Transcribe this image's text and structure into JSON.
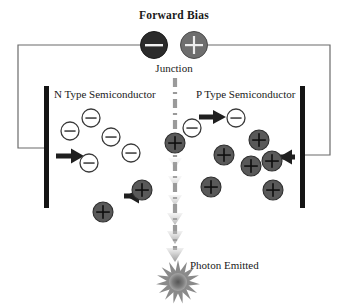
{
  "diagram": {
    "title": "Forward Bias",
    "junction_label": "Junction",
    "n_region_label": "N Type Semiconductor",
    "p_region_label": "P Type Semiconductor",
    "photon_label": "Photon Emitted",
    "battery": {
      "negative_terminal_symbol": "−",
      "positive_terminal_symbol": "+",
      "negative_terminal_color": "#2b2b2b",
      "positive_terminal_color": "#6e6e6e"
    },
    "colors": {
      "wire": "#6b6b6b",
      "electrode": "#141414",
      "electron_outline": "#3a3a3a",
      "hole_fill": "#595959",
      "hole_outline": "#2e2e2e",
      "arrow": "#1f1f1f",
      "junction_line": "#9a9a9a",
      "photon": "#7d7d7d",
      "text": "#1a1a1a"
    },
    "electrons": [
      {
        "id": "electron-1",
        "cx": 70,
        "cy": 131,
        "r": 9,
        "sign": "−"
      },
      {
        "id": "electron-2",
        "cx": 91,
        "cy": 118,
        "r": 9,
        "sign": "−"
      },
      {
        "id": "electron-3",
        "cx": 89,
        "cy": 163,
        "r": 9,
        "sign": "−"
      },
      {
        "id": "electron-4",
        "cx": 111,
        "cy": 137,
        "r": 9,
        "sign": "−"
      },
      {
        "id": "electron-5",
        "cx": 131,
        "cy": 153,
        "r": 9,
        "sign": "−"
      },
      {
        "id": "electron-6",
        "cx": 192,
        "cy": 128,
        "r": 9,
        "sign": "−"
      },
      {
        "id": "electron-7",
        "cx": 236,
        "cy": 118,
        "r": 9,
        "sign": "−"
      }
    ],
    "holes": [
      {
        "id": "hole-junction",
        "cx": 175,
        "cy": 143,
        "r": 10,
        "sign": "+"
      },
      {
        "id": "hole-1",
        "cx": 103,
        "cy": 212,
        "r": 10,
        "sign": "+"
      },
      {
        "id": "hole-2",
        "cx": 142,
        "cy": 190,
        "r": 10,
        "sign": "+"
      },
      {
        "id": "hole-3",
        "cx": 224,
        "cy": 155,
        "r": 10,
        "sign": "+"
      },
      {
        "id": "hole-4",
        "cx": 211,
        "cy": 187,
        "r": 10,
        "sign": "+"
      },
      {
        "id": "hole-5",
        "cx": 259,
        "cy": 140,
        "r": 10,
        "sign": "+"
      },
      {
        "id": "hole-6",
        "cx": 251,
        "cy": 166,
        "r": 10,
        "sign": "+"
      },
      {
        "id": "hole-7",
        "cx": 272,
        "cy": 161,
        "r": 10,
        "sign": "+"
      },
      {
        "id": "hole-8",
        "cx": 273,
        "cy": 190,
        "r": 10,
        "sign": "+"
      }
    ],
    "arrows": [
      {
        "id": "arrow-electron-flow-in",
        "direction": "right",
        "x": 56,
        "y": 156,
        "length": 26
      },
      {
        "id": "arrow-hole-flow-left",
        "direction": "left",
        "x": 112,
        "y": 196,
        "length": 28
      },
      {
        "id": "arrow-electron-flow-junction",
        "direction": "right",
        "x": 205,
        "y": 117,
        "length": 26
      },
      {
        "id": "arrow-hole-flow-in",
        "direction": "left",
        "x": 265,
        "y": 157,
        "length": 28
      }
    ],
    "electrodes": [
      {
        "id": "electrode-left",
        "x": 44,
        "y": 86,
        "width": 5,
        "height": 122
      },
      {
        "id": "electrode-right",
        "x": 300,
        "y": 86,
        "width": 5,
        "height": 122
      }
    ]
  }
}
